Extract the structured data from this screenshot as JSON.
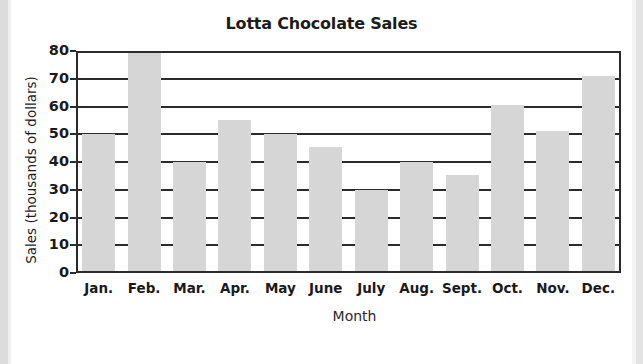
{
  "chart_data": {
    "type": "bar",
    "title": "Lotta Chocolate Sales",
    "xlabel": "Month",
    "ylabel": "Sales (thousands of dollars)",
    "categories": [
      "Jan.",
      "Feb.",
      "Mar.",
      "Apr.",
      "May",
      "June",
      "July",
      "Aug.",
      "Sept.",
      "Oct.",
      "Nov.",
      "Dec."
    ],
    "values": [
      50,
      80,
      40,
      55,
      50,
      45.5,
      30,
      40,
      35.5,
      60.5,
      51,
      71
    ],
    "ylim": [
      0,
      80
    ],
    "ytick_labels": [
      "80",
      "70",
      "60",
      "50",
      "40",
      "30",
      "20",
      "10",
      "0"
    ],
    "ytick_values": [
      80,
      70,
      60,
      50,
      40,
      30,
      20,
      10,
      0
    ],
    "grid": true,
    "legend": "none",
    "bar_color": "#d6d6d6",
    "axis_color": "#2b2b2b",
    "background_color": "#ffffff"
  }
}
